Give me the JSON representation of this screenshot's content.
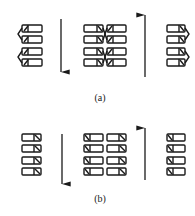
{
  "panels": [
    {
      "id": "a",
      "label": "(a)",
      "description": "Domains with tilted dipoles converging toward domain boundaries; downward field arrow left, upward field arrow right",
      "arrows": [
        {
          "name": "field-arrow-down",
          "direction": "down"
        },
        {
          "name": "field-arrow-up",
          "direction": "up"
        }
      ],
      "columns": 4,
      "rows_per_column": 4
    },
    {
      "id": "b",
      "label": "(b)",
      "description": "Domains with aligned diagonal dipoles; downward field arrow left, upward field arrow right",
      "arrows": [
        {
          "name": "field-arrow-down",
          "direction": "down"
        },
        {
          "name": "field-arrow-up",
          "direction": "up"
        }
      ],
      "columns": 4,
      "rows_per_column": 4
    }
  ],
  "colors": {
    "stroke": "#1a1a1a",
    "background": "#ffffff"
  }
}
